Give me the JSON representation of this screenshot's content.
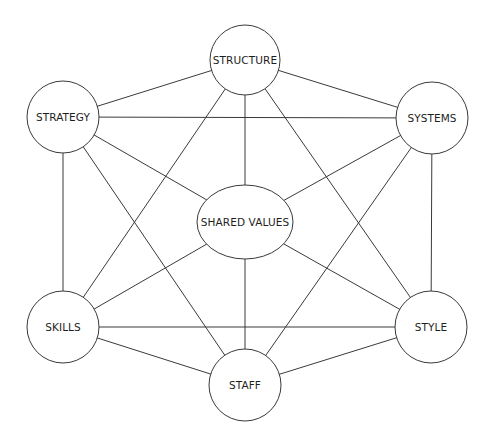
{
  "diagram": {
    "colors": {
      "line": "#3a3a3a",
      "text": "#1e1e1e",
      "background": "#ffffff"
    },
    "nodes": [
      {
        "id": "structure",
        "label": "STRUCTURE",
        "shape": "circle",
        "cx": 245,
        "cy": 60,
        "r": 35
      },
      {
        "id": "strategy",
        "label": "STRATEGY",
        "shape": "circle",
        "cx": 63,
        "cy": 117,
        "r": 36
      },
      {
        "id": "systems",
        "label": "SYSTEMS",
        "shape": "circle",
        "cx": 432,
        "cy": 118,
        "r": 36
      },
      {
        "id": "shared_values",
        "label": "SHARED VALUES",
        "shape": "ellipse",
        "cx": 245,
        "cy": 222,
        "rx": 48,
        "ry": 37
      },
      {
        "id": "skills",
        "label": "SKILLS",
        "shape": "circle",
        "cx": 63,
        "cy": 327,
        "r": 36
      },
      {
        "id": "style",
        "label": "STYLE",
        "shape": "circle",
        "cx": 431,
        "cy": 327,
        "r": 36
      },
      {
        "id": "staff",
        "label": "STAFF",
        "shape": "circle",
        "cx": 245,
        "cy": 385,
        "r": 36
      }
    ],
    "edges": [
      [
        "structure",
        "strategy"
      ],
      [
        "structure",
        "systems"
      ],
      [
        "structure",
        "shared_values"
      ],
      [
        "structure",
        "skills"
      ],
      [
        "structure",
        "style"
      ],
      [
        "strategy",
        "systems"
      ],
      [
        "strategy",
        "shared_values"
      ],
      [
        "strategy",
        "skills"
      ],
      [
        "strategy",
        "staff"
      ],
      [
        "systems",
        "shared_values"
      ],
      [
        "systems",
        "staff"
      ],
      [
        "systems",
        "style"
      ],
      [
        "shared_values",
        "skills"
      ],
      [
        "shared_values",
        "staff"
      ],
      [
        "shared_values",
        "style"
      ],
      [
        "skills",
        "style"
      ],
      [
        "skills",
        "staff"
      ],
      [
        "staff",
        "style"
      ]
    ]
  }
}
